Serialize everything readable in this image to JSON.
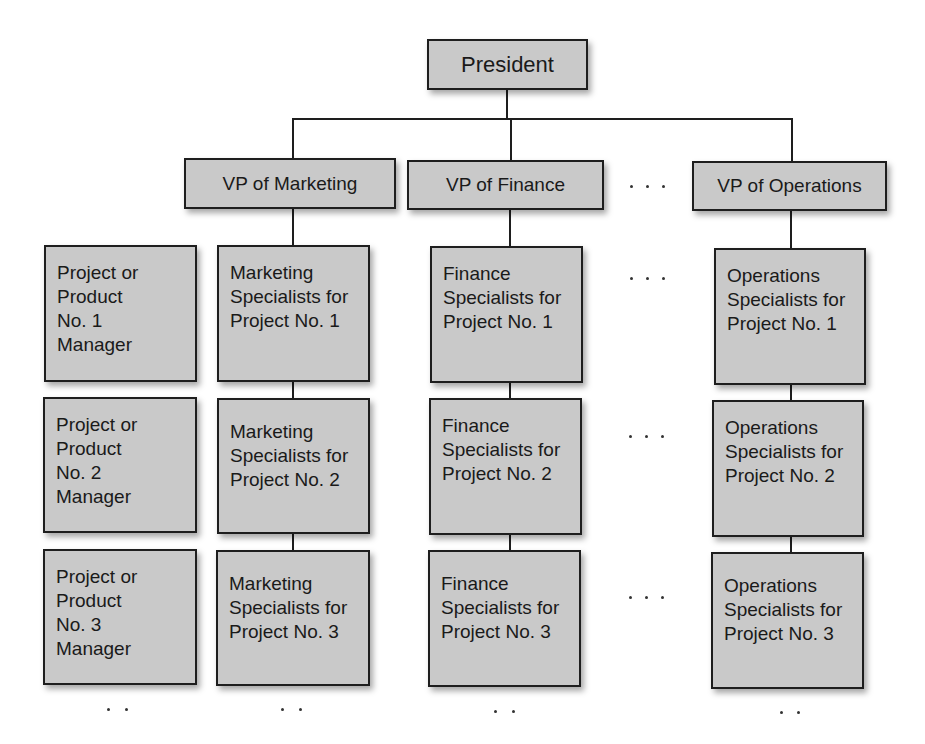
{
  "president": {
    "label": "President"
  },
  "vps": [
    {
      "label": "VP of Marketing"
    },
    {
      "label": "VP of Finance"
    },
    {
      "label": "VP of Operations"
    }
  ],
  "ellipsis": "...",
  "managers": [
    {
      "label": "Project or\nProduct\nNo. 1\nManager"
    },
    {
      "label": "Project or\nProduct\nNo. 2\nManager"
    },
    {
      "label": "Project or\nProduct\nNo. 3\nManager"
    }
  ],
  "marketing_specialists": [
    {
      "label": "Marketing\nSpecialists for\nProject No. 1"
    },
    {
      "label": "Marketing\nSpecialists for\nProject No. 2"
    },
    {
      "label": "Marketing\nSpecialists for\nProject No. 3"
    }
  ],
  "finance_specialists": [
    {
      "label": "Finance\nSpecialists for\nProject No. 1"
    },
    {
      "label": "Finance\nSpecialists for\nProject No. 2"
    },
    {
      "label": "Finance\nSpecialists for\nProject No. 3"
    }
  ],
  "operations_specialists": [
    {
      "label": "Operations\nSpecialists for\nProject No. 1"
    },
    {
      "label": "Operations\nSpecialists for\nProject No. 2"
    },
    {
      "label": "Operations\nSpecialists for\nProject No. 3"
    }
  ],
  "colors": {
    "box_fill": "#c9c9c9",
    "border": "#1e1e1e",
    "background": "#ffffff"
  }
}
